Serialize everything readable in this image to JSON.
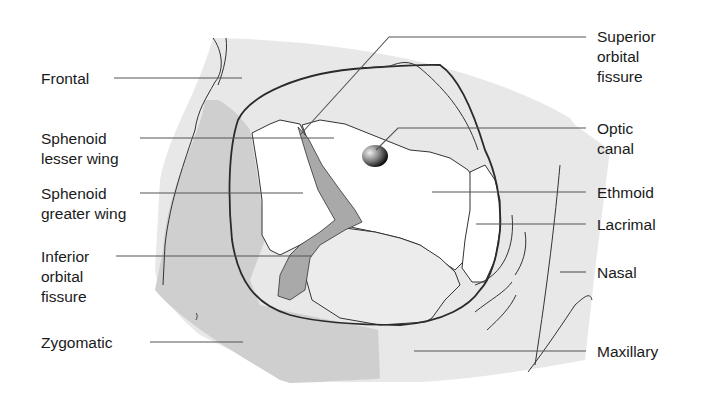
{
  "diagram": {
    "colors": {
      "light_bone": "#e8e8e8",
      "mid_bone": "#cfcfcf",
      "dark_bone": "#a9a9a9",
      "background": "#ffffff",
      "line": "#2a2a2a"
    },
    "labels_left": [
      {
        "id": "frontal",
        "lines": [
          "Frontal"
        ]
      },
      {
        "id": "sphenoid-lesser-wing",
        "lines": [
          "Sphenoid",
          "lesser wing"
        ]
      },
      {
        "id": "sphenoid-greater-wing",
        "lines": [
          "Sphenoid",
          "greater wing"
        ]
      },
      {
        "id": "inferior-orbital-fissure",
        "lines": [
          "Inferior",
          "orbital",
          "fissure"
        ]
      },
      {
        "id": "zygomatic",
        "lines": [
          "Zygomatic"
        ]
      }
    ],
    "labels_right": [
      {
        "id": "superior-orbital-fissure",
        "lines": [
          "Superior",
          "orbital",
          "fissure"
        ]
      },
      {
        "id": "optic-canal",
        "lines": [
          "Optic",
          "canal"
        ]
      },
      {
        "id": "ethmoid",
        "lines": [
          "Ethmoid"
        ]
      },
      {
        "id": "lacrimal",
        "lines": [
          "Lacrimal"
        ]
      },
      {
        "id": "nasal",
        "lines": [
          "Nasal"
        ]
      },
      {
        "id": "maxillary",
        "lines": [
          "Maxillary"
        ]
      }
    ]
  }
}
